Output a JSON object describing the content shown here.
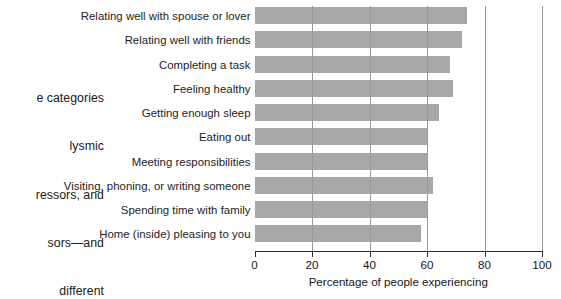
{
  "caption": {
    "lines": [
      "e categories",
      "lysmic",
      "ressors, and",
      "sors—and",
      " different"
    ]
  },
  "chart_data": {
    "type": "bar",
    "orientation": "horizontal",
    "title": "",
    "subtitle": "",
    "xlabel": "Percentage of people experiencing",
    "ylabel": "",
    "xlim": [
      0,
      100
    ],
    "ylim": [],
    "grid": true,
    "grid_axis": "x",
    "legend": false,
    "legend_position": "none",
    "bar_color": "#a7a7a7",
    "axis_color": "#2b2b2b",
    "categories": [
      "Relating well with spouse or lover",
      "Relating well with friends",
      "Completing a task",
      "Feeling healthy",
      "Getting enough sleep",
      "Eating out",
      "Meeting responsibilities",
      "Visiting, phoning, or writing someone",
      "Spending time with family",
      "Home (inside) pleasing to you"
    ],
    "values": [
      74,
      72,
      68,
      69,
      64,
      60,
      60,
      62,
      60,
      58
    ],
    "xticks": [
      0,
      20,
      40,
      60,
      80,
      100
    ],
    "xticklabels": [
      "0",
      "20",
      "40",
      "60",
      "80",
      "100"
    ]
  }
}
